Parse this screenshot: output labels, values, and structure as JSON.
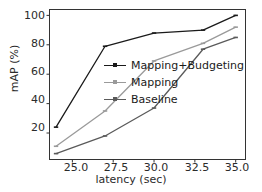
{
  "chart_data": {
    "type": "line",
    "title": "",
    "xlabel": "latency (sec)",
    "ylabel": "mAP (%)",
    "xlim": [
      23.6,
      35.6
    ],
    "ylim": [
      2,
      104
    ],
    "xticks": [
      "25.0",
      "27.5",
      "30.0",
      "32.5",
      "35.0"
    ],
    "xtick_values": [
      25.0,
      27.5,
      30.0,
      32.5,
      35.0
    ],
    "yticks": [
      "20",
      "40",
      "60",
      "80",
      "100"
    ],
    "ytick_values": [
      20,
      40,
      60,
      80,
      100
    ],
    "grid": false,
    "legend_position": "center",
    "series": [
      {
        "name": "Mapping+Budgeting",
        "color": "#1a1a1a",
        "x": [
          24.0,
          27.0,
          30.0,
          33.0,
          35.0
        ],
        "values": [
          24,
          79,
          88,
          90,
          100
        ]
      },
      {
        "name": "Mapping",
        "color": "#9a9a9a",
        "x": [
          24.0,
          27.0,
          30.0,
          33.0,
          35.0
        ],
        "values": [
          11,
          35,
          69,
          81,
          92
        ]
      },
      {
        "name": "Baseline",
        "color": "#5a5a5a",
        "x": [
          24.0,
          27.0,
          30.0,
          33.0,
          35.0
        ],
        "values": [
          6,
          18,
          37,
          77,
          85
        ]
      }
    ]
  },
  "legend": {
    "items": [
      {
        "label": "Mapping+Budgeting",
        "color": "#1a1a1a"
      },
      {
        "label": "Mapping",
        "color": "#9a9a9a"
      },
      {
        "label": "Baseline",
        "color": "#5a5a5a"
      }
    ]
  },
  "axes": {
    "xlabel": "latency (sec)",
    "ylabel": "mAP (%)",
    "xtick_0": "25.0",
    "xtick_1": "27.5",
    "xtick_2": "30.0",
    "xtick_3": "32.5",
    "xtick_4": "35.0",
    "ytick_0": "20",
    "ytick_1": "40",
    "ytick_2": "60",
    "ytick_3": "80",
    "ytick_4": "100"
  }
}
